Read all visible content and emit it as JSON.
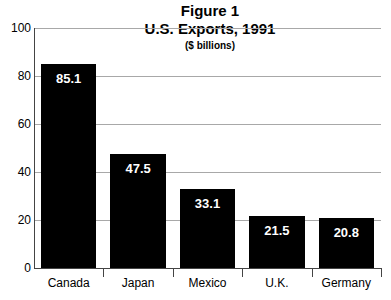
{
  "chart_data": {
    "type": "bar",
    "title": "Figure 1",
    "subtitle": "U.S. Exports, 1991",
    "units_label": "($ billions)",
    "categories": [
      "Canada",
      "Japan",
      "Mexico",
      "U.K.",
      "Germany"
    ],
    "values": [
      85.1,
      47.5,
      33.1,
      21.5,
      20.8
    ],
    "value_labels": [
      "85.1",
      "47.5",
      "33.1",
      "21.5",
      "20.8"
    ],
    "xlabel": "",
    "ylabel": "",
    "ylim": [
      0,
      100
    ],
    "yticks": [
      100,
      80,
      60,
      40,
      20,
      0
    ],
    "ytick_labels": [
      "100",
      "80",
      "60",
      "40",
      "20",
      "0"
    ],
    "grid": true,
    "legend": false,
    "bar_color": "#000000",
    "value_label_color": "#ffffff",
    "grid_color": "#a8a8a8",
    "axis_color": "#444444",
    "background_color": "#ffffff"
  }
}
